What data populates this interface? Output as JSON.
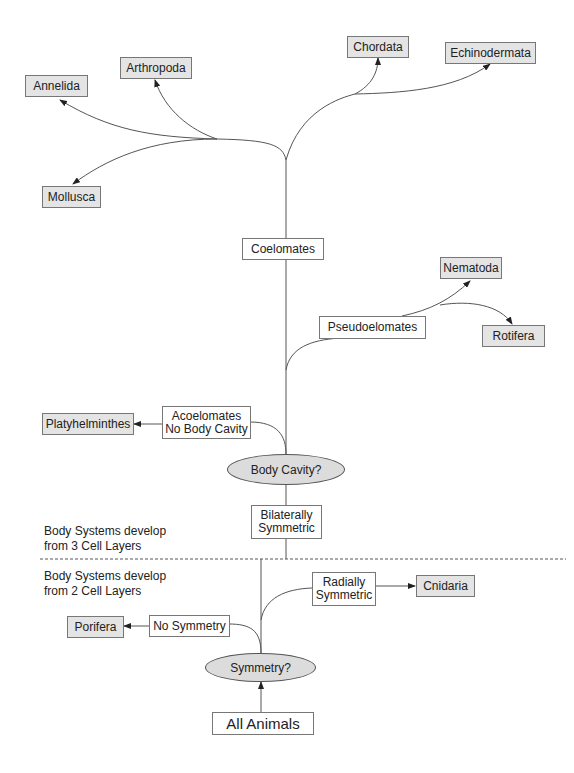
{
  "diagram": {
    "type": "phylogenetic-flowchart",
    "root": "All Animals",
    "decisions": {
      "symmetry": "Symmetry?",
      "body_cavity": "Body Cavity?"
    },
    "groups": {
      "no_symmetry": "No Symmetry",
      "radially_symmetric": [
        "Radially",
        "Symmetric"
      ],
      "bilaterally_symmetric": [
        "Bilaterally",
        "Symmetric"
      ],
      "acoelomates": [
        "Acoelomates",
        "No Body Cavity"
      ],
      "pseudoelomates": "Pseudoelomates",
      "coelomates": "Coelomates"
    },
    "phyla": {
      "porifera": "Porifera",
      "cnidaria": "Cnidaria",
      "platyhelminthes": "Platyhelminthes",
      "nematoda": "Nematoda",
      "rotifera": "Rotifera",
      "annelida": "Annelida",
      "arthropoda": "Arthropoda",
      "mollusca": "Mollusca",
      "chordata": "Chordata",
      "echinodermata": "Echinodermata"
    },
    "notes": {
      "three_layers": [
        "Body Systems develop",
        "from 3 Cell Layers"
      ],
      "two_layers": [
        "Body Systems develop",
        "from 2 Cell Layers"
      ]
    },
    "colors": {
      "phylum_fill": "#e4e4e4",
      "decision_fill": "#dcdcdc",
      "line": "#555555"
    }
  }
}
